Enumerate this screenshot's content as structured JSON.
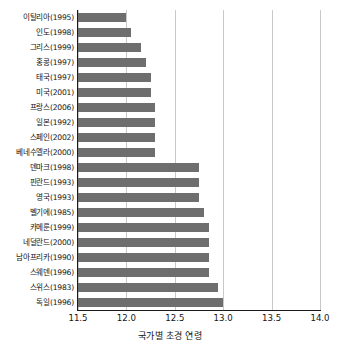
{
  "chart_data": {
    "type": "bar",
    "orientation": "horizontal",
    "title": "",
    "xlabel": "국가별 초경 연령",
    "ylabel": "",
    "xlim": [
      11.5,
      14.0
    ],
    "xticks": [
      "11.5",
      "12.0",
      "12.5",
      "13.0",
      "13.5",
      "14.0"
    ],
    "xtick_values": [
      11.5,
      12.0,
      12.5,
      13.0,
      13.5,
      14.0
    ],
    "grid": "vertical",
    "legend": "none",
    "bar_color": "#6e6e6e",
    "categories": [
      "이탈리아(1995)",
      "인도(1998)",
      "그리스(1999)",
      "홍콩(1997)",
      "태국(1997)",
      "미국(2001)",
      "프랑스(2006)",
      "일본(1992)",
      "스페인(2002)",
      "베네수엘라(2000)",
      "덴마크(1998)",
      "핀란드(1993)",
      "영국(1993)",
      "벨기에(1985)",
      "카메룬(1999)",
      "네덜란드(2000)",
      "남아프리카(1990)",
      "스웨덴(1996)",
      "스위스(1983)",
      "독일(1996)"
    ],
    "values": [
      12.0,
      12.05,
      12.15,
      12.2,
      12.25,
      12.25,
      12.3,
      12.3,
      12.3,
      12.3,
      12.75,
      12.75,
      12.75,
      12.8,
      12.85,
      12.85,
      12.85,
      12.85,
      12.95,
      13.0
    ]
  }
}
